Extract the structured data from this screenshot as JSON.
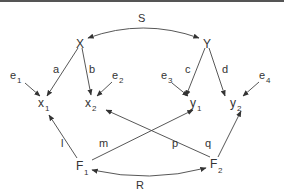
{
  "diagram": {
    "title": "",
    "latent": {
      "X": {
        "label": "X",
        "x": 80,
        "y": 44
      },
      "Y": {
        "label": "Y",
        "x": 207,
        "y": 44
      },
      "F1": {
        "label": "F",
        "sub": "1",
        "x": 80,
        "y": 168
      },
      "F2": {
        "label": "F",
        "sub": "2",
        "x": 214,
        "y": 166
      }
    },
    "observed": {
      "x1": {
        "label": "x",
        "sub": "1",
        "x": 41,
        "y": 105
      },
      "x2": {
        "label": "x",
        "sub": "2",
        "x": 87,
        "y": 105
      },
      "y1": {
        "label": "y",
        "sub": "1",
        "x": 194,
        "y": 105
      },
      "y2": {
        "label": "y",
        "sub": "2",
        "x": 234,
        "y": 105
      }
    },
    "errors": {
      "e1": {
        "label": "e",
        "sub": "1",
        "x": 15,
        "y": 78
      },
      "e2": {
        "label": "e",
        "sub": "2",
        "x": 114,
        "y": 78
      },
      "e3": {
        "label": "e",
        "sub": "3",
        "x": 167,
        "y": 78
      },
      "e4": {
        "label": "e",
        "sub": "4",
        "x": 261,
        "y": 78
      }
    },
    "paths": {
      "S": "S",
      "a": "a",
      "b": "b",
      "c": "c",
      "d": "d",
      "l": "l",
      "m": "m",
      "p": "p",
      "q": "q",
      "R": "R"
    },
    "edges": [
      {
        "from": "X",
        "to": "x1",
        "label": "a"
      },
      {
        "from": "X",
        "to": "x2",
        "label": "b"
      },
      {
        "from": "Y",
        "to": "y1",
        "label": "c"
      },
      {
        "from": "Y",
        "to": "y2",
        "label": "d"
      },
      {
        "from": "e1",
        "to": "x1"
      },
      {
        "from": "e2",
        "to": "x2"
      },
      {
        "from": "e3",
        "to": "y1"
      },
      {
        "from": "e4",
        "to": "y2"
      },
      {
        "from": "F1",
        "to": "x1",
        "label": "l"
      },
      {
        "from": "F1",
        "to": "y1",
        "label": "m"
      },
      {
        "from": "F2",
        "to": "x2",
        "label": "p"
      },
      {
        "from": "F2",
        "to": "y2",
        "label": "q"
      },
      {
        "from": "X",
        "to": "Y",
        "label": "S",
        "type": "covariance"
      },
      {
        "from": "F1",
        "to": "F2",
        "label": "R",
        "type": "covariance"
      }
    ]
  }
}
